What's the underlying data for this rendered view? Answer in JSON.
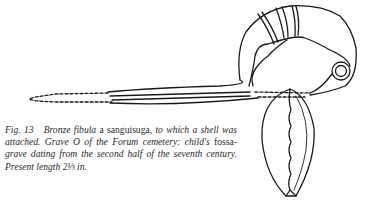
{
  "figure": {
    "label": "Fig. 13",
    "illustration": "bronze-fibula-with-shell-line-drawing",
    "caption": {
      "part1": "Bronze ",
      "part2": "fibula",
      "part3": " a sanguisuga, ",
      "part4": "to which a shell was attached. Grave O of the Forum cemetery: child's ",
      "part5": "fossa-",
      "part6": "grave dating from the second half of the seventh century. Present length 2⅓ in."
    },
    "ink_color": "#1a1a1a"
  }
}
